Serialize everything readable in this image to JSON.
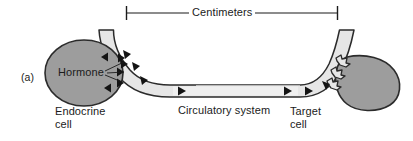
{
  "figure": {
    "panel_letter": "(a)",
    "scale_bar": {
      "label": "Centimeters",
      "left_tick_x": 126,
      "right_tick_x": 338,
      "baseline_y": 13
    },
    "labels": {
      "hormone": "Hormone",
      "endocrine_cell": "Endocrine\ncell",
      "circulatory_system": "Circulatory system",
      "target_cell": "Target\ncell"
    },
    "colors": {
      "cell_fill": "#9d9d9d",
      "cell_stroke": "#2b2b2b",
      "vessel_fill": "#e6e6e6",
      "vessel_stroke": "#2b2b2b",
      "marker_fill": "#141414",
      "text": "#1b1b1b",
      "background": "#ffffff"
    },
    "elements": {
      "endocrine_cell_shape": "ellipse",
      "target_cell_shape": "rounded-blob",
      "vessel_shape": "curved-tube",
      "hormone_marker": "filled-triangle",
      "receptor_marker": "zigzag-receptor"
    },
    "counts": {
      "hormone_markers_in_cell": 4,
      "hormone_markers_in_vessel": 6,
      "receptors_on_target_cell": 3
    }
  }
}
